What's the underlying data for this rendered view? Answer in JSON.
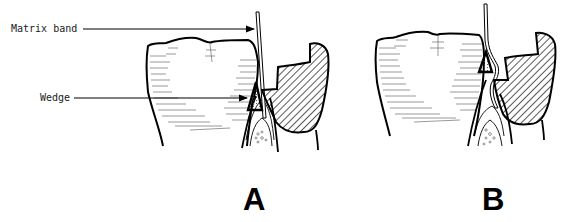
{
  "figure": {
    "labels": {
      "matrix_band": "Matrix band",
      "wedge": "Wedge"
    },
    "panels": [
      {
        "letter": "A"
      },
      {
        "letter": "B"
      }
    ],
    "colors": {
      "ink": "#000000",
      "background": "#ffffff",
      "hatch": "#000000",
      "stipple": "#555555"
    }
  }
}
